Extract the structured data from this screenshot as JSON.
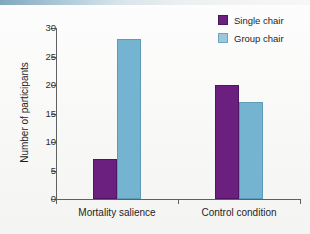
{
  "chart_data": {
    "type": "bar",
    "title": "",
    "subtitle": "",
    "xlabel": "",
    "ylabel": "Number of participants",
    "categories": [
      "Mortality salience",
      "Control condition"
    ],
    "series": [
      {
        "name": "Single chair",
        "color": "#6b2080",
        "values": [
          7,
          20
        ]
      },
      {
        "name": "Group chair",
        "color": "#74b4d1",
        "values": [
          28,
          17
        ]
      }
    ],
    "ylim": [
      0,
      30
    ],
    "yticks": [
      0,
      5,
      10,
      15,
      20,
      25,
      30
    ],
    "ytick_labels": [
      "0",
      "5",
      "10",
      "15",
      "20",
      "25",
      "30"
    ],
    "grid": false,
    "legend_position": "top-right"
  },
  "legend": {
    "items": [
      {
        "label": "Single chair",
        "swatch": "purple-swatch"
      },
      {
        "label": "Group chair",
        "swatch": "blue-swatch"
      }
    ]
  },
  "axes": {
    "y_title": "Number of participants",
    "y_labels": [
      "30",
      "25",
      "20",
      "15",
      "10",
      "5",
      "0"
    ],
    "x_labels": [
      "Mortality salience",
      "Control condition"
    ]
  }
}
